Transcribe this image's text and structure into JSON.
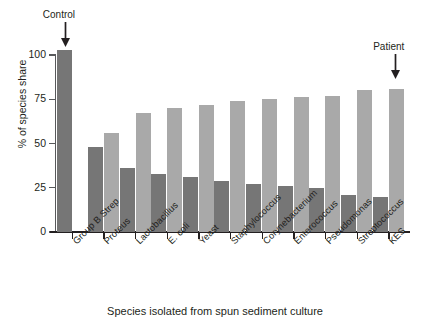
{
  "chart_data": {
    "type": "bar",
    "title": "",
    "xlabel": "Species isolated from spun sediment culture",
    "ylabel": "% of species share",
    "ylim": [
      0,
      110
    ],
    "yticks": [
      0,
      25,
      50,
      75,
      100
    ],
    "ytick_labels": [
      "0",
      "25",
      "50",
      "75",
      "100"
    ],
    "grid": false,
    "legend": "none",
    "categories": [
      "Group B Strep",
      "Proteus",
      "Lactobacillus",
      "E. coli",
      "Yeast",
      "Staphylococcus",
      "Corynebacterium",
      "Enterococcus",
      "Pseudomonas",
      "Streptococcus",
      "KES"
    ],
    "series": [
      {
        "name": "dark",
        "color": "#767676",
        "values": [
          103,
          48,
          36,
          33,
          31,
          29,
          27,
          26,
          25,
          21,
          20
        ]
      },
      {
        "name": "light",
        "color": "#a9a9a9",
        "values": [
          null,
          56,
          67,
          70,
          72,
          74,
          75,
          76,
          77,
          80,
          81
        ]
      }
    ],
    "annotations": [
      {
        "text": "Control",
        "target_category": "Group B Strep",
        "arrow": "down"
      },
      {
        "text": "Patient",
        "target_category": "KES",
        "arrow": "down"
      }
    ]
  },
  "colors": {
    "dark_bar": "#767676",
    "light_bar": "#a9a9a9",
    "axis": "#231f20",
    "background": "#ffffff"
  }
}
